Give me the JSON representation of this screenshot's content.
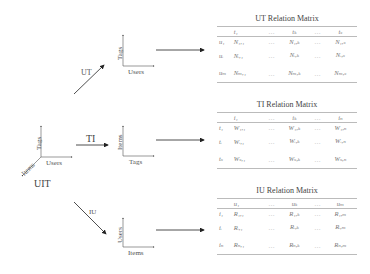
{
  "left": {
    "uit_label": "UIT",
    "uit_axes": {
      "y": "Tags",
      "x": "Users",
      "z": "Items"
    },
    "arrows": {
      "ut": "UT",
      "ti": "TI",
      "iu": "IU"
    }
  },
  "mini_plots": {
    "ut": {
      "y": "Tags",
      "x": "Users"
    },
    "ti": {
      "y": "Items",
      "x": "Tags"
    },
    "iu": {
      "y": "Users",
      "x": "Items"
    }
  },
  "matrices": {
    "ut": {
      "title": "UT  Relation Matrix",
      "cols": [
        "t₁",
        "…",
        "tₖ",
        "…",
        "tₛ"
      ],
      "rows": [
        {
          "label": "u₁",
          "cells": [
            "N₁,₁",
            "N₁,ₖ",
            "N₁,ₛ"
          ]
        },
        {
          "label": "uᵢ",
          "cells": [
            "Nᵢ,₁",
            "Nᵢ,ₖ",
            "Nᵢ,ₛ"
          ]
        },
        {
          "label": "uₘ",
          "cells": [
            "Nₘ,₁",
            "Nₘ,ₖ",
            "Nₘ,ₛ"
          ]
        }
      ]
    },
    "ti": {
      "title": "TI  Relation Matrix",
      "cols": [
        "i₁",
        "…",
        "iₖ",
        "…",
        "iₙ"
      ],
      "rows": [
        {
          "label": "t₁",
          "cells": [
            "W₁,₁",
            "W₁,ₖ",
            "W₁,ₙ"
          ]
        },
        {
          "label": "tᵢ",
          "cells": [
            "Wᵢ,₁",
            "Wᵢ,ₖ",
            "Wᵢ,ₙ"
          ]
        },
        {
          "label": "tₛ",
          "cells": [
            "Wₛ,₁",
            "Wₛ,ₖ",
            "Wₛ,ₙ"
          ]
        }
      ]
    },
    "iu": {
      "title": "IU  Relation Matrix",
      "cols": [
        "u₁",
        "…",
        "uₖ",
        "…",
        "uₘ"
      ],
      "rows": [
        {
          "label": "i₁",
          "cells": [
            "R₁,₁",
            "R₁,ₖ",
            "R₁,ₘ"
          ]
        },
        {
          "label": "iᵢ",
          "cells": [
            "Rᵢ,₁",
            "Rᵢ,ₖ",
            "Rᵢ,ₘ"
          ]
        },
        {
          "label": "iₙ",
          "cells": [
            "Rₙ,₁",
            "Rₙ,ₖ",
            "Rₙ,ₘ"
          ]
        }
      ]
    }
  }
}
